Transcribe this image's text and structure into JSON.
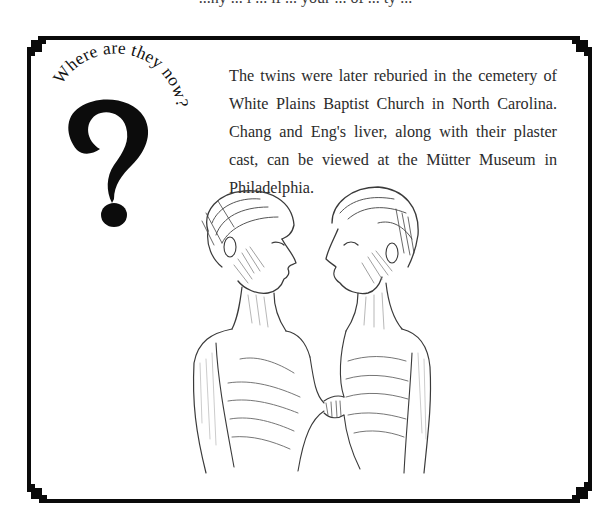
{
  "top_cutoff_text": "...ny ... i ... lf ... your ... of ... ty ...",
  "callout": {
    "curved_heading": "Where are they now?",
    "glyph": "?",
    "icon": "question-mark-icon"
  },
  "paragraph": {
    "text": "The twins were later reburied in the cemetery of White Plains Baptist Church in North Carolina. Chang and Eng's liver, along with their plaster cast, can be viewed at the Mütter Museum in Philadelphia."
  },
  "illustration": {
    "subject": "Pencil sketch of conjoined twins Chang and Eng facing each other, joined at the chest",
    "stroke_color": "#3a3a3a"
  },
  "frame": {
    "color": "#0a0a0a",
    "background": "#ffffff"
  }
}
